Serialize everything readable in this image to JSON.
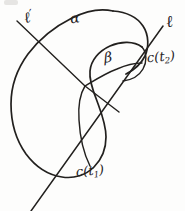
{
  "figure": {
    "kind": "hand-drawn-geometry-diagram",
    "background_color": "#fdfdfc",
    "ink_color": "#22201e",
    "width": 185,
    "height": 211,
    "labels": [
      {
        "id": "ell-prime",
        "name": "line-ell-prime-label",
        "text": "ℓ",
        "prime": "′",
        "meaning": "line ell prime",
        "x": 24,
        "y": 9
      },
      {
        "id": "ell",
        "name": "line-ell-label",
        "text": "ℓ",
        "meaning": "line ell",
        "x": 166,
        "y": 14
      },
      {
        "id": "alpha",
        "name": "arc-alpha-label",
        "text": "α",
        "meaning": "arc alpha",
        "x": 70,
        "y": 11
      },
      {
        "id": "beta",
        "name": "arc-beta-label",
        "text": "β",
        "meaning": "arc beta",
        "x": 104,
        "y": 50
      },
      {
        "id": "c-t2",
        "name": "point-c-t2-label",
        "text": "c(t",
        "subscript": "2",
        "tail": ")",
        "meaning": "curve point c of t two",
        "x": 147,
        "y": 50
      },
      {
        "id": "c-t1",
        "name": "point-c-t1-label",
        "text": "c(t",
        "subscript": "1",
        "tail": ")",
        "meaning": "curve point c of t one",
        "x": 76,
        "y": 164
      }
    ],
    "strokes": {
      "closed_curve": "M 116,10 C 96,8 78,14 62,24 C 46,34 30,48 20,66 C 12,82 10,100 12,118 C 14,138 22,156 36,167 C 50,178 70,180 86,172 C 100,165 108,152 112,138 C 116,124 114,110 110,98 C 106,86 100,76 98,66 C 96,54 102,44 112,40 C 124,35 138,36 145,44 C 151,51 150,62 144,70 C 138,78 128,82 118,80",
      "upper_right_lobe": "M 116,10 C 128,11 140,16 146,26 C 151,35 150,48 145,58 C 141,66 134,72 126,76",
      "beta_arc": "M 86,86 C 96,78 108,70 120,66 C 128,63 136,62 142,63",
      "tangent_line_ell": "M 163,27 L 32,211",
      "chord_ell_prime": "M 18,22 L 86,86",
      "segment_center_to_ell": "M 86,86 L 119,111"
    }
  }
}
